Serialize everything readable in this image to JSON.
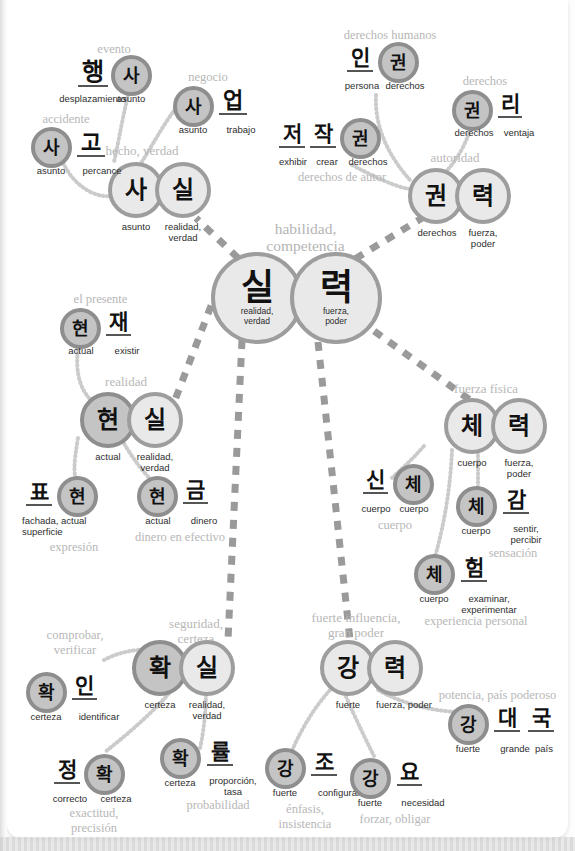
{
  "diagram": {
    "title": "habilidad, competencia",
    "type": "korean-vocabulary-mindmap",
    "colors": {
      "node_light_fill": "#e9e9e9",
      "node_dark_fill": "#c4c4c4",
      "node_stroke": "#9d9d9d",
      "gloss_text": "#2e2e2e",
      "meaning_text": "#b7b7b7",
      "page_background": "#ffffff",
      "dashed_link": "#9a9a9a",
      "dotted_link": "#cfcfcf"
    }
  },
  "center": {
    "meaning": "habilidad,",
    "meaning2": "competencia",
    "left": {
      "char": "실",
      "gloss": "realidad,",
      "gloss2": "verdad"
    },
    "right": {
      "char": "력",
      "gloss": "fuerza,",
      "gloss2": "poder"
    }
  },
  "branches": [
    {
      "id": "sasil",
      "meaning": "hecho, verdad",
      "chars": [
        {
          "char": "사",
          "gloss": "asunto",
          "shape": "circle-light"
        },
        {
          "char": "실",
          "gloss": "realidad,\nverdad",
          "shape": "circle-light"
        }
      ]
    },
    {
      "id": "haengsa",
      "meaning": "evento",
      "chars": [
        {
          "char": "행",
          "gloss": "desplazamiento",
          "shape": "plain"
        },
        {
          "char": "사",
          "gloss": "asunto",
          "shape": "circle-dark"
        }
      ]
    },
    {
      "id": "sago",
      "meaning": "accidente",
      "chars": [
        {
          "char": "사",
          "gloss": "asunto",
          "shape": "circle-dark"
        },
        {
          "char": "고",
          "gloss": "percance",
          "shape": "plain"
        }
      ]
    },
    {
      "id": "saeop",
      "meaning": "negocio",
      "chars": [
        {
          "char": "사",
          "gloss": "asunto",
          "shape": "circle-dark"
        },
        {
          "char": "업",
          "gloss": "trabajo",
          "shape": "plain"
        }
      ]
    },
    {
      "id": "gwonryeok",
      "meaning": "autoridad",
      "chars": [
        {
          "char": "권",
          "gloss": "derechos",
          "shape": "circle-light"
        },
        {
          "char": "력",
          "gloss": "fuerza,\npoder",
          "shape": "circle-light"
        }
      ]
    },
    {
      "id": "ingwon",
      "meaning": "derechos humanos",
      "chars": [
        {
          "char": "인",
          "gloss": "persona",
          "shape": "plain"
        },
        {
          "char": "권",
          "gloss": "derechos",
          "shape": "circle-dark"
        }
      ]
    },
    {
      "id": "gwolli",
      "meaning": "derechos",
      "chars": [
        {
          "char": "권",
          "gloss": "derechos",
          "shape": "circle-dark"
        },
        {
          "char": "리",
          "gloss": "ventaja",
          "shape": "plain"
        }
      ]
    },
    {
      "id": "jeojakgwon",
      "meaning": "derechos de autor",
      "chars": [
        {
          "char": "저",
          "gloss": "exhibir",
          "shape": "plain"
        },
        {
          "char": "작",
          "gloss": "crear",
          "shape": "plain"
        },
        {
          "char": "권",
          "gloss": "derechos",
          "shape": "circle-dark"
        }
      ]
    },
    {
      "id": "hyeonsil",
      "meaning": "realidad",
      "chars": [
        {
          "char": "현",
          "gloss": "actual",
          "shape": "circle-dark"
        },
        {
          "char": "실",
          "gloss": "realidad,\nverdad",
          "shape": "circle-light"
        }
      ]
    },
    {
      "id": "hyeonjae",
      "meaning": "el presente",
      "chars": [
        {
          "char": "현",
          "gloss": "actual",
          "shape": "circle-dark"
        },
        {
          "char": "재",
          "gloss": "existir",
          "shape": "plain"
        }
      ]
    },
    {
      "id": "pyohyeon",
      "meaning": "expresión",
      "chars": [
        {
          "char": "표",
          "gloss": "fachada,\nsuperficie",
          "shape": "plain"
        },
        {
          "char": "현",
          "gloss": "actual",
          "shape": "circle-dark"
        }
      ]
    },
    {
      "id": "hyeongeum",
      "meaning": "dinero en efectivo",
      "chars": [
        {
          "char": "현",
          "gloss": "actual",
          "shape": "circle-dark"
        },
        {
          "char": "금",
          "gloss": "dinero",
          "shape": "plain"
        }
      ]
    },
    {
      "id": "cheryeok",
      "meaning": "fuerza física",
      "chars": [
        {
          "char": "체",
          "gloss": "cuerpo",
          "shape": "circle-light"
        },
        {
          "char": "력",
          "gloss": "fuerza,\npoder",
          "shape": "circle-light"
        }
      ]
    },
    {
      "id": "sinche",
      "meaning": "cuerpo",
      "chars": [
        {
          "char": "신",
          "gloss": "cuerpo",
          "shape": "plain"
        },
        {
          "char": "체",
          "gloss": "cuerpo",
          "shape": "circle-dark"
        }
      ]
    },
    {
      "id": "chegam",
      "meaning": "sensación",
      "chars": [
        {
          "char": "체",
          "gloss": "cuerpo",
          "shape": "circle-dark"
        },
        {
          "char": "감",
          "gloss": "sentir,\npercibir",
          "shape": "plain"
        }
      ]
    },
    {
      "id": "cheheom",
      "meaning": "experiencia personal",
      "chars": [
        {
          "char": "체",
          "gloss": "cuerpo",
          "shape": "circle-dark"
        },
        {
          "char": "험",
          "gloss": "examinar,\nexperimentar",
          "shape": "plain"
        }
      ]
    },
    {
      "id": "hwaksil",
      "meaning": "seguridad, certeza",
      "chars": [
        {
          "char": "확",
          "gloss": "certeza",
          "shape": "circle-dark"
        },
        {
          "char": "실",
          "gloss": "realidad,\nverdad",
          "shape": "circle-light"
        }
      ]
    },
    {
      "id": "hwagin",
      "meaning": "comprobar, verificar",
      "chars": [
        {
          "char": "확",
          "gloss": "certeza",
          "shape": "circle-dark"
        },
        {
          "char": "인",
          "gloss": "identificar",
          "shape": "plain"
        }
      ]
    },
    {
      "id": "jeonghwak",
      "meaning": "exactitud, precisión",
      "chars": [
        {
          "char": "정",
          "gloss": "correcto",
          "shape": "plain"
        },
        {
          "char": "확",
          "gloss": "certeza",
          "shape": "circle-dark"
        }
      ]
    },
    {
      "id": "hwangnyul",
      "meaning": "probabilidad",
      "chars": [
        {
          "char": "확",
          "gloss": "certeza",
          "shape": "circle-dark"
        },
        {
          "char": "률",
          "gloss": "proporción,\ntasa",
          "shape": "plain"
        }
      ]
    },
    {
      "id": "gangnyeok",
      "meaning": "fuerte influencia, gran poder",
      "chars": [
        {
          "char": "강",
          "gloss": "fuerte",
          "shape": "circle-light"
        },
        {
          "char": "력",
          "gloss": "fuerza, poder",
          "shape": "circle-light"
        }
      ]
    },
    {
      "id": "gangdaeguk",
      "meaning": "potencia, país poderoso",
      "chars": [
        {
          "char": "강",
          "gloss": "fuerte",
          "shape": "circle-dark"
        },
        {
          "char": "대",
          "gloss": "grande",
          "shape": "plain"
        },
        {
          "char": "국",
          "gloss": "país",
          "shape": "plain"
        }
      ]
    },
    {
      "id": "gangjo",
      "meaning": "énfasis, insistencia",
      "chars": [
        {
          "char": "강",
          "gloss": "fuerte",
          "shape": "circle-dark"
        },
        {
          "char": "조",
          "gloss": "configurar",
          "shape": "plain"
        }
      ]
    },
    {
      "id": "gangyo",
      "meaning": "forzar, obligar",
      "chars": [
        {
          "char": "강",
          "gloss": "fuerte",
          "shape": "circle-dark"
        },
        {
          "char": "요",
          "gloss": "necesidad",
          "shape": "plain"
        }
      ]
    }
  ],
  "labels": {
    "evento": "evento",
    "accidente": "accidente",
    "negocio": "negocio",
    "hecho_verdad": "hecho, verdad",
    "derechos_humanos": "derechos humanos",
    "derechos": "derechos",
    "derechos_de_autor": "derechos de autor",
    "autoridad": "autoridad",
    "el_presente": "el presente",
    "realidad": "realidad",
    "expresion": "expresión",
    "dinero_en_efectivo": "dinero en efectivo",
    "fuerza_fisica": "fuerza física",
    "cuerpo": "cuerpo",
    "sensacion": "sensación",
    "experiencia_personal": "experiencia personal",
    "seguridad1": "seguridad,",
    "seguridad2": "certeza",
    "comprobar1": "comprobar,",
    "comprobar2": "verificar",
    "exactitud1": "exactitud,",
    "exactitud2": "precisión",
    "probabilidad": "probabilidad",
    "fuerte_influencia1": "fuerte influencia,",
    "fuerte_influencia2": "gran poder",
    "potencia_pais": "potencia, país poderoso",
    "enfasis1": "énfasis,",
    "enfasis2": "insistencia",
    "forzar": "forzar, obligar"
  },
  "glosses": {
    "desplazamiento": "desplazamiento",
    "asunto": "asunto",
    "percance": "percance",
    "trabajo": "trabajo",
    "realidad_verdad1": "realidad,",
    "realidad_verdad2": "verdad",
    "persona": "persona",
    "derechos": "derechos",
    "ventaja": "ventaja",
    "exhibir": "exhibir",
    "crear": "crear",
    "fuerza1": "fuerza,",
    "fuerza2": "poder",
    "actual": "actual",
    "existir": "existir",
    "fachada1": "fachada, actual",
    "fachada2": "superficie",
    "dinero": "dinero",
    "cuerpo": "cuerpo",
    "sentir1": "sentir,",
    "sentir2": "percibir",
    "examinar1": "examinar,",
    "examinar2": "experimentar",
    "certeza": "certeza",
    "identificar": "identificar",
    "correcto": "correcto",
    "proporcion1": "proporción,",
    "proporcion2": "tasa",
    "fuerte": "fuerte",
    "fuerza_poder": "fuerza, poder",
    "grande": "grande",
    "pais": "país",
    "configurar": "configurar",
    "necesidad": "necesidad"
  }
}
